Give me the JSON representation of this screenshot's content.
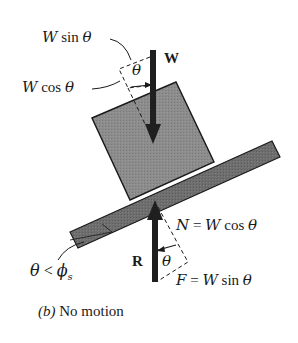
{
  "diagram": {
    "caption_prefix": "(b)",
    "caption_text": " No motion",
    "colors": {
      "block_fill": "#8a8a8a",
      "plane_fill": "#6f6f6f",
      "outline": "#1a1a1a",
      "arrow": "#1f1f1f",
      "background": "#ffffff"
    },
    "labels": {
      "w_sin_theta": {
        "var": "W",
        "fn": " sin ",
        "ang": "θ"
      },
      "w_cos_theta": {
        "var": "W",
        "fn": " cos ",
        "ang": "θ"
      },
      "weight": "W",
      "top_angle": "θ",
      "normal": {
        "var": "N",
        "eq": " = ",
        "rhs_var": "W",
        "fn": " cos ",
        "ang": "θ"
      },
      "reaction": "R",
      "bottom_angle": "θ",
      "friction": {
        "var": "F",
        "eq": " = ",
        "rhs_var": "W",
        "fn": " sin ",
        "ang": "θ"
      },
      "condition": {
        "lhs": "θ",
        "op": " < ",
        "rhs": "ϕ",
        "rhs_sub": "s"
      }
    }
  }
}
